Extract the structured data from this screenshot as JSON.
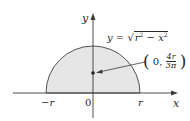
{
  "figure": {
    "type": "semicircle-centroid-diagram",
    "colors": {
      "fill": "#e6e6e6",
      "stroke": "#555555",
      "axis": "#3a3a3a",
      "point": "#222222"
    },
    "axes": {
      "x_label": "x",
      "y_label": "y"
    },
    "ticks": {
      "neg_r": "−r",
      "origin": "0",
      "pos_r": "r"
    },
    "curve": {
      "equation_lhs": "y",
      "equation_eq": "=",
      "equation_sqrt_symbol": "√",
      "equation_radicand_r": "r",
      "equation_radicand_r_exp": "2",
      "equation_radicand_minus": " − ",
      "equation_radicand_x": "x",
      "equation_radicand_x_exp": "2"
    },
    "centroid": {
      "open_paren": "(",
      "x_value": "0,",
      "y_numerator": "4r",
      "y_denominator": "3π",
      "close_paren": ")"
    }
  }
}
